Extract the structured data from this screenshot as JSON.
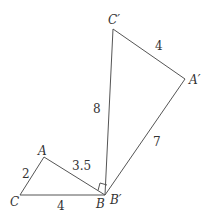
{
  "diagram": {
    "type": "geometry",
    "colors": {
      "stroke": "#555555",
      "text": "#333333",
      "background": "#ffffff"
    },
    "triangle_abc": {
      "vertices": {
        "A": {
          "label": "A",
          "x": 44,
          "y": 157
        },
        "B": {
          "label": "B",
          "x": 105,
          "y": 195
        },
        "C": {
          "label": "C",
          "x": 20,
          "y": 195
        }
      },
      "sides": {
        "AC": "2",
        "AB": "3.5",
        "CB": "4"
      }
    },
    "triangle_a1b1c1": {
      "vertices": {
        "A1": {
          "label": "A′",
          "x": 185,
          "y": 79
        },
        "B1": {
          "label": "B′",
          "x": 105,
          "y": 195
        },
        "C1": {
          "label": "C′",
          "x": 113,
          "y": 29
        }
      },
      "sides": {
        "C1A1": "4",
        "C1B1": "8",
        "A1B1": "7"
      }
    },
    "right_angle_at": "B"
  }
}
